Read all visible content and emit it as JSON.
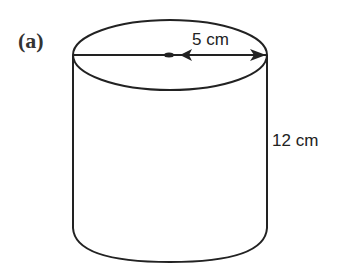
{
  "figure": {
    "part_label": "(a)",
    "shape": "cylinder",
    "radius_label": "5 cm",
    "height_label": "12 cm",
    "stroke_color": "#222222"
  }
}
